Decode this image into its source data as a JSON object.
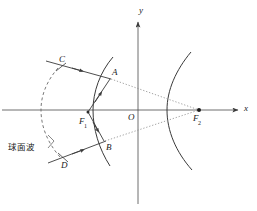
{
  "figure": {
    "width": 257,
    "height": 211,
    "background": "#ffffff",
    "stroke_color": "#3a3a3a",
    "dotted_color": "#8a8a8a",
    "dashed_color": "#6a6a6a",
    "label_color": "#1a1a1a"
  },
  "axes": {
    "x_label": "x",
    "y_label": "y",
    "origin_label": "O",
    "x_axis": {
      "y": 110,
      "x_start": 0,
      "x_end": 240
    },
    "y_axis": {
      "x": 138,
      "y_start": 20,
      "y_end": 205
    }
  },
  "points": {
    "A": {
      "label": "A",
      "x": 110,
      "y": 78
    },
    "B": {
      "label": "B",
      "x": 104,
      "y": 141
    },
    "C": {
      "label": "C",
      "x": 61,
      "y": 66
    },
    "D": {
      "label": "D",
      "x": 64,
      "y": 158
    },
    "F1": {
      "label": "F",
      "sub": "1",
      "x": 88,
      "y": 112
    },
    "F2": {
      "label": "F",
      "sub": "2",
      "x": 199,
      "y": 110
    },
    "O": {
      "label": "O",
      "x": 138,
      "y": 110
    }
  },
  "annotations": {
    "spherical_wave": "球面波"
  },
  "curves": {
    "left_mirror": "左侧抛物面反射弧",
    "right_mirror": "右侧抛物面反射弧",
    "wavefront": "球面波前虚线弧"
  },
  "rays": {
    "incoming_c_to_a": "C→A 入射光线",
    "incoming_d_to_b": "D→B 入射光线",
    "f1_to_a": "F1→A 光线",
    "f1_to_b": "F1→B 光线",
    "a_to_f2": "A→F2 虚线",
    "b_to_f2": "B→F2 虚线"
  }
}
